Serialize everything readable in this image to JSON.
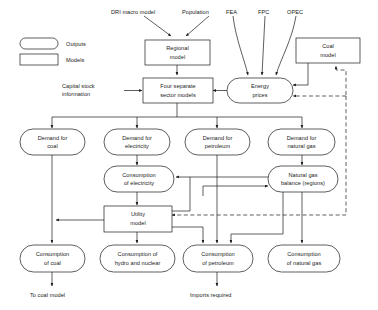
{
  "diagram": {
    "legend": [
      {
        "id": "legend-outputs",
        "label": "Outputs",
        "shape": "pill"
      },
      {
        "id": "legend-models",
        "label": "Models",
        "shape": "rect"
      }
    ],
    "inputs": [
      {
        "id": "input-dri",
        "label": "DRI macro model"
      },
      {
        "id": "input-population",
        "label": "Population"
      },
      {
        "id": "input-fea",
        "label": "FEA"
      },
      {
        "id": "input-fpc",
        "label": "FPC"
      },
      {
        "id": "input-opec",
        "label": "OPEC"
      }
    ],
    "annotations": [
      {
        "id": "annotation-capital-stock",
        "line1": "Capital stock",
        "line2": "information"
      },
      {
        "id": "annotation-to-coal-model",
        "line1": "To coal model",
        "line2": ""
      },
      {
        "id": "annotation-imports-required",
        "line1": "Imports required",
        "line2": ""
      }
    ],
    "models": [
      {
        "id": "node-regional-model",
        "line1": "Regional",
        "line2": "model"
      },
      {
        "id": "node-coal-model",
        "line1": "Coal",
        "line2": "model"
      },
      {
        "id": "node-four-sector-models",
        "line1": "Four separate",
        "line2": "sector models"
      },
      {
        "id": "node-utility-model",
        "line1": "Utility",
        "line2": "model"
      }
    ],
    "outputs": [
      {
        "id": "node-energy-prices",
        "line1": "Energy",
        "line2": "prices"
      },
      {
        "id": "node-demand-coal",
        "line1": "Demand for",
        "line2": "coal"
      },
      {
        "id": "node-demand-electricity",
        "line1": "Demand for",
        "line2": "electricity"
      },
      {
        "id": "node-demand-petroleum",
        "line1": "Demand for",
        "line2": "petroleum"
      },
      {
        "id": "node-demand-natural-gas",
        "line1": "Demand for",
        "line2": "natural gas"
      },
      {
        "id": "node-consumption-electricity",
        "line1": "Consumption",
        "line2": "of electricity"
      },
      {
        "id": "node-natural-gas-balance",
        "line1": "Natural gas",
        "line2": "balance (regions)"
      },
      {
        "id": "node-consumption-coal",
        "line1": "Consumption",
        "line2": "of coal"
      },
      {
        "id": "node-consumption-hydro-nuclear",
        "line1": "Consumption of",
        "line2": "hydro and nuclear"
      },
      {
        "id": "node-consumption-petroleum",
        "line1": "Consumption",
        "line2": "of petroleum"
      },
      {
        "id": "node-consumption-natural-gas",
        "line1": "Consumption",
        "line2": "of natural gas"
      }
    ],
    "colors": {
      "stroke": "#1a1a1a",
      "fill": "#ffffff",
      "background": "#ffffff"
    }
  }
}
